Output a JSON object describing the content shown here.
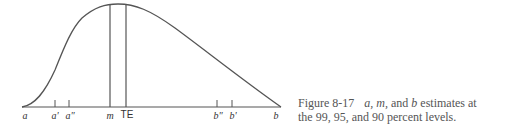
{
  "figure": {
    "number": "Figure 8-17",
    "caption_line1_pre": "a, m,",
    "caption_line1_mid": " and ",
    "caption_line1_b": "b",
    "caption_line1_post": " estimates at",
    "caption_line2": "the 99, 95, and 90 percent levels."
  },
  "axis_labels": {
    "a": "a",
    "a_prime": "a'",
    "a_double_prime": "a\"",
    "m": "m",
    "te": "TE",
    "b_double_prime": "b\"",
    "b_prime": "b'",
    "b": "b"
  },
  "colors": {
    "stroke": "#555555",
    "caption": "#555555"
  }
}
